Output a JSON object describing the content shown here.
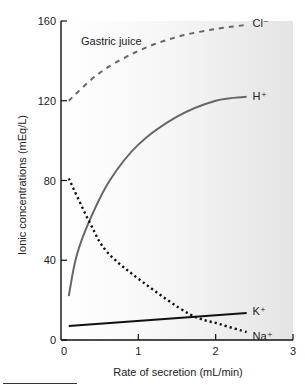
{
  "chart_data": {
    "type": "line",
    "title": "",
    "annotation": "Gastric juice",
    "xlabel": "Rate of secretion (mL/min)",
    "ylabel": "Ionic concentrations (mEq/L)",
    "xlim": [
      0,
      3
    ],
    "ylim": [
      0,
      160
    ],
    "xticks": [
      0,
      1,
      2,
      3
    ],
    "yticks": [
      0,
      40,
      80,
      120,
      160
    ],
    "grid": false,
    "legend": "inline labels at line ends",
    "series": [
      {
        "name": "Cl⁻",
        "style": "dashed",
        "color": "#666666",
        "x": [
          0.1,
          0.5,
          1.0,
          1.5,
          2.0,
          2.4
        ],
        "values": [
          120,
          134,
          145,
          152,
          156,
          158
        ]
      },
      {
        "name": "H⁺",
        "style": "solid",
        "color": "#666666",
        "x": [
          0.1,
          0.2,
          0.37,
          0.63,
          1.0,
          1.5,
          2.0,
          2.4
        ],
        "values": [
          22,
          42,
          60,
          80,
          98,
          112,
          120,
          122
        ]
      },
      {
        "name": "Na⁺",
        "style": "dotted",
        "color": "#111111",
        "x": [
          0.1,
          0.37,
          0.6,
          1.06,
          1.66,
          2.05,
          2.4
        ],
        "values": [
          81,
          59,
          44,
          29,
          13,
          8,
          4
        ]
      },
      {
        "name": "K⁺",
        "style": "solid",
        "color": "#111111",
        "x": [
          0.1,
          2.4
        ],
        "values": [
          7,
          13.5
        ]
      }
    ]
  }
}
